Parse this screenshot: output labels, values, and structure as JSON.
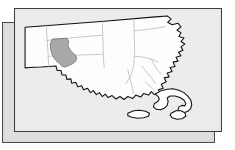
{
  "figure": {
    "kind": "locator-map",
    "subject_state": "Massachusetts",
    "highlighted_county": "Hampshire County",
    "panels": {
      "back_panel_label": "back-shadow-panel",
      "front_panel_label": "front-map-panel"
    }
  },
  "colors": {
    "page_background": "#ffffff",
    "back_panel_fill": "#dedede",
    "back_panel_border": "#4a4a4a",
    "front_panel_fill": "#ececec",
    "front_panel_border": "#3c3c3c",
    "state_fill": "#fdfdfd",
    "state_outline": "#111111",
    "county_line": "#b4b4b4",
    "highlight_fill": "#a9a9a9",
    "highlight_outline": "#6e6e6e",
    "island_fill": "#fdfdfd"
  },
  "map": {
    "state_outline_name": "massachusetts-state-outline",
    "highlight_name": "hampshire-county-highlight",
    "regions": [
      "Berkshire",
      "Franklin",
      "Hampshire",
      "Hampden",
      "Worcester",
      "Middlesex",
      "Essex",
      "Suffolk",
      "Norfolk",
      "Bristol",
      "Plymouth",
      "Barnstable",
      "Dukes",
      "Nantucket"
    ],
    "islands": [
      "Marthas Vineyard",
      "Nantucket"
    ],
    "features": {
      "cape_cod": "cape-cod-hook",
      "cape_ann": "cape-ann-headland"
    }
  }
}
